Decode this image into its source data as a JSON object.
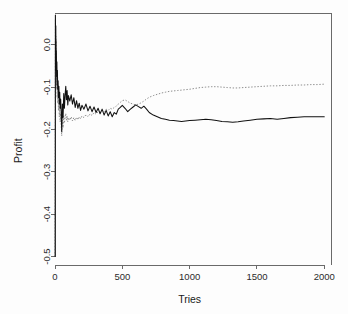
{
  "chart_data": {
    "type": "line",
    "title": "",
    "xlabel": "Tries",
    "ylabel": "Profit",
    "xlim": [
      0,
      2050
    ],
    "ylim": [
      -0.52,
      0.075
    ],
    "grid": false,
    "legend": null,
    "box": "open-L",
    "xticks": [
      0,
      500,
      1000,
      1500,
      2000
    ],
    "xticklabels": [
      "0",
      "500",
      "1000",
      "1500",
      "2000"
    ],
    "yticks": [
      0.0,
      -0.1,
      -0.2,
      -0.3,
      -0.4,
      -0.5
    ],
    "yticklabels": [
      "0.0",
      "-0.1",
      "-0.2",
      "-0.3",
      "-0.4",
      "-0.5"
    ],
    "series": [
      {
        "name": "solid-black-curve",
        "style": "solid",
        "color": "#111111",
        "x": [
          1,
          2,
          3,
          4,
          5,
          6,
          7,
          8,
          9,
          10,
          12,
          14,
          16,
          18,
          20,
          23,
          26,
          29,
          32,
          35,
          38,
          42,
          46,
          50,
          55,
          60,
          65,
          70,
          75,
          80,
          85,
          90,
          95,
          100,
          110,
          120,
          130,
          140,
          150,
          160,
          170,
          180,
          190,
          200,
          215,
          230,
          245,
          260,
          275,
          290,
          305,
          320,
          335,
          350,
          365,
          380,
          395,
          410,
          425,
          440,
          455,
          470,
          485,
          500,
          520,
          540,
          560,
          580,
          600,
          620,
          640,
          660,
          680,
          700,
          730,
          760,
          790,
          820,
          850,
          880,
          910,
          940,
          970,
          1000,
          1040,
          1080,
          1120,
          1160,
          1200,
          1240,
          1280,
          1320,
          1360,
          1400,
          1450,
          1500,
          1550,
          1600,
          1650,
          1700,
          1750,
          1800,
          1850,
          1900,
          1950,
          2000
        ],
        "y": [
          -0.5,
          -0.245,
          0.07,
          0.03,
          -0.06,
          0.045,
          -0.03,
          0.01,
          -0.05,
          -0.015,
          -0.075,
          -0.04,
          -0.095,
          -0.06,
          -0.105,
          -0.085,
          -0.125,
          -0.098,
          -0.14,
          -0.112,
          -0.15,
          -0.128,
          -0.16,
          -0.205,
          -0.14,
          -0.172,
          -0.115,
          -0.15,
          -0.118,
          -0.098,
          -0.13,
          -0.108,
          -0.142,
          -0.12,
          -0.133,
          -0.118,
          -0.14,
          -0.125,
          -0.148,
          -0.132,
          -0.15,
          -0.138,
          -0.155,
          -0.143,
          -0.152,
          -0.14,
          -0.156,
          -0.145,
          -0.158,
          -0.147,
          -0.16,
          -0.15,
          -0.163,
          -0.152,
          -0.166,
          -0.155,
          -0.168,
          -0.158,
          -0.17,
          -0.16,
          -0.164,
          -0.152,
          -0.148,
          -0.143,
          -0.15,
          -0.158,
          -0.152,
          -0.147,
          -0.142,
          -0.146,
          -0.15,
          -0.145,
          -0.152,
          -0.16,
          -0.166,
          -0.17,
          -0.174,
          -0.176,
          -0.178,
          -0.179,
          -0.18,
          -0.181,
          -0.18,
          -0.179,
          -0.178,
          -0.177,
          -0.176,
          -0.177,
          -0.179,
          -0.181,
          -0.182,
          -0.183,
          -0.182,
          -0.18,
          -0.178,
          -0.176,
          -0.175,
          -0.174,
          -0.176,
          -0.174,
          -0.172,
          -0.171,
          -0.17,
          -0.17,
          -0.17,
          -0.17
        ]
      },
      {
        "name": "dotted-gray-curve",
        "style": "dotted",
        "color": "#8e8e8e",
        "x": [
          1,
          2,
          3,
          4,
          5,
          6,
          7,
          8,
          9,
          10,
          12,
          14,
          16,
          18,
          20,
          23,
          26,
          29,
          32,
          35,
          38,
          42,
          46,
          50,
          55,
          60,
          65,
          70,
          75,
          80,
          85,
          90,
          95,
          100,
          110,
          120,
          130,
          140,
          150,
          160,
          170,
          180,
          190,
          200,
          215,
          230,
          245,
          260,
          275,
          290,
          305,
          320,
          335,
          350,
          365,
          380,
          395,
          410,
          425,
          440,
          455,
          470,
          485,
          500,
          520,
          540,
          560,
          580,
          600,
          620,
          640,
          660,
          680,
          700,
          730,
          760,
          790,
          820,
          850,
          880,
          910,
          940,
          970,
          1000,
          1040,
          1080,
          1120,
          1160,
          1200,
          1240,
          1280,
          1320,
          1360,
          1400,
          1450,
          1500,
          1550,
          1600,
          1650,
          1700,
          1750,
          1800,
          1850,
          1900,
          1950,
          2000
        ],
        "y": [
          -0.5,
          -0.25,
          0.06,
          0.015,
          -0.08,
          0.02,
          -0.055,
          -0.01,
          -0.085,
          -0.045,
          -0.105,
          -0.07,
          -0.125,
          -0.095,
          -0.138,
          -0.115,
          -0.155,
          -0.13,
          -0.17,
          -0.148,
          -0.182,
          -0.162,
          -0.19,
          -0.215,
          -0.178,
          -0.196,
          -0.168,
          -0.185,
          -0.17,
          -0.162,
          -0.178,
          -0.168,
          -0.182,
          -0.172,
          -0.178,
          -0.17,
          -0.18,
          -0.172,
          -0.179,
          -0.171,
          -0.177,
          -0.17,
          -0.175,
          -0.168,
          -0.172,
          -0.165,
          -0.17,
          -0.163,
          -0.167,
          -0.16,
          -0.164,
          -0.158,
          -0.161,
          -0.155,
          -0.158,
          -0.152,
          -0.155,
          -0.15,
          -0.152,
          -0.148,
          -0.145,
          -0.14,
          -0.136,
          -0.132,
          -0.13,
          -0.134,
          -0.138,
          -0.14,
          -0.142,
          -0.14,
          -0.137,
          -0.133,
          -0.128,
          -0.124,
          -0.12,
          -0.117,
          -0.114,
          -0.112,
          -0.11,
          -0.109,
          -0.108,
          -0.107,
          -0.106,
          -0.105,
          -0.103,
          -0.101,
          -0.1,
          -0.099,
          -0.099,
          -0.1,
          -0.101,
          -0.102,
          -0.102,
          -0.101,
          -0.1,
          -0.099,
          -0.098,
          -0.097,
          -0.097,
          -0.096,
          -0.096,
          -0.095,
          -0.095,
          -0.094,
          -0.094,
          -0.093
        ]
      }
    ]
  }
}
